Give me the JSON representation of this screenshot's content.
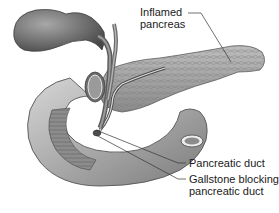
{
  "figure": {
    "style": "grayscale",
    "labels": {
      "inflamed_pancreas": [
        "Inflamed",
        "pancreas"
      ],
      "pancreatic_duct": "Pancreatic duct",
      "gallstone_blocking": [
        "Gallstone blocking",
        "pancreatic duct"
      ]
    },
    "colors": {
      "background": "#ffffff",
      "organ_dark": "#5e5e5e",
      "organ_mid": "#9a9a9a",
      "organ_light": "#cfcfcf",
      "leader_line": "#333333",
      "text": "#1a1a1a"
    }
  }
}
